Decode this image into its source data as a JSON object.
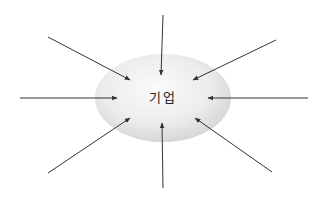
{
  "diagram": {
    "center_label": "기업",
    "center": {
      "cx": 163,
      "cy": 98,
      "rx": 68,
      "ry": 44
    },
    "colors": {
      "ellipse_highlight": "#fafafa",
      "ellipse_mid": "#e8e8e8",
      "ellipse_edge": "#cfcfcf",
      "arrow": "#333333",
      "background": "#ffffff"
    },
    "arrows": [
      {
        "name": "arrow-top",
        "x1": 163,
        "y1": 15,
        "x2": 161,
        "y2": 75
      },
      {
        "name": "arrow-top-left",
        "x1": 48,
        "y1": 37,
        "x2": 130,
        "y2": 80
      },
      {
        "name": "arrow-top-right",
        "x1": 276,
        "y1": 40,
        "x2": 193,
        "y2": 80
      },
      {
        "name": "arrow-left",
        "x1": 20,
        "y1": 98,
        "x2": 117,
        "y2": 98
      },
      {
        "name": "arrow-right",
        "x1": 308,
        "y1": 98,
        "x2": 208,
        "y2": 98
      },
      {
        "name": "arrow-bottom-left",
        "x1": 48,
        "y1": 173,
        "x2": 130,
        "y2": 118
      },
      {
        "name": "arrow-bottom",
        "x1": 163,
        "y1": 188,
        "x2": 162,
        "y2": 123
      },
      {
        "name": "arrow-bottom-right",
        "x1": 272,
        "y1": 172,
        "x2": 195,
        "y2": 118
      }
    ]
  }
}
